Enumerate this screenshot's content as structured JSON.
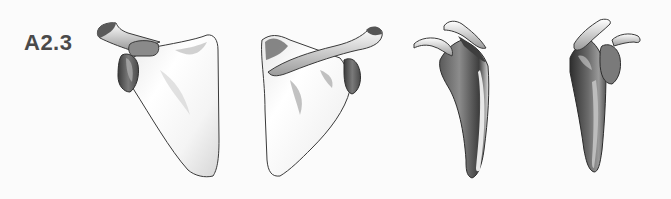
{
  "figure": {
    "panel_label": "A2.3",
    "views": [
      {
        "name": "posterior view",
        "position": "left"
      },
      {
        "name": "anterior view",
        "position": "center-left"
      },
      {
        "name": "lateral view",
        "position": "center-right"
      },
      {
        "name": "medial-lateral oblique view",
        "position": "right"
      }
    ]
  },
  "colors": {
    "background": "#fbfbfb",
    "label": "#4a4a4a",
    "bone_light": "#ffffff",
    "bone_mid": "#c8c8c8",
    "bone_dark": "#4e4e4e",
    "outline": "#3a3a3a"
  }
}
